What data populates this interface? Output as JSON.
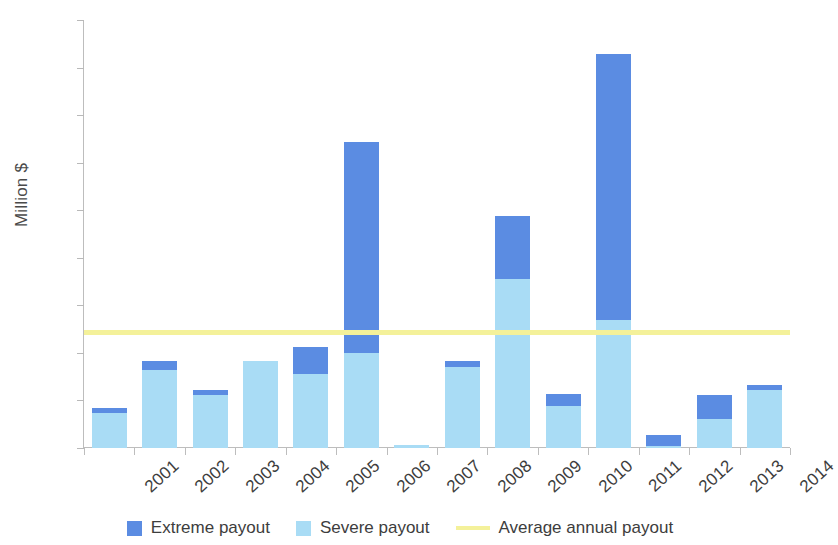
{
  "chart_data": {
    "type": "bar",
    "subtype": "stacked-bar-with-reference-line",
    "title": "",
    "xlabel": "",
    "ylabel": "Million $",
    "ylim": [
      0,
      45
    ],
    "ytick_step": 5,
    "yticks": [
      0,
      5,
      10,
      15,
      20,
      25,
      30,
      35,
      40,
      45
    ],
    "ytick_labels": [
      "0",
      "5",
      "10",
      "15",
      "20",
      "25",
      "30",
      "35",
      "40",
      "45"
    ],
    "grid": false,
    "legend_position": "bottom-center",
    "categories": [
      "2001",
      "2002",
      "2003",
      "2004",
      "2005",
      "2006",
      "2007",
      "2008",
      "2009",
      "2010",
      "2011",
      "2012",
      "2013",
      "2014"
    ],
    "series": [
      {
        "name": "Severe payout",
        "color": "#a9dcf5",
        "values": [
          3.7,
          8.2,
          5.6,
          9.1,
          7.8,
          10.0,
          0.3,
          8.5,
          17.8,
          4.4,
          13.5,
          0.2,
          3.1,
          6.1
        ]
      },
      {
        "name": "Extreme payout",
        "color": "#5b8ce2",
        "values": [
          0.5,
          0.9,
          0.5,
          0.0,
          2.8,
          22.2,
          0.0,
          0.7,
          6.6,
          1.3,
          27.9,
          1.2,
          2.5,
          0.5
        ]
      }
    ],
    "totals": [
      4.2,
      9.1,
      6.1,
      9.1,
      10.6,
      32.2,
      0.3,
      9.2,
      24.4,
      5.7,
      41.4,
      1.4,
      5.6,
      6.6
    ],
    "reference_line": {
      "name": "Average annual payout",
      "value": 12.2,
      "color": "#f4f19a"
    }
  },
  "legend": {
    "items": [
      {
        "label": "Extreme payout",
        "marker": "square",
        "color": "#5b8ce2"
      },
      {
        "label": "Severe payout",
        "marker": "square",
        "color": "#a9dcf5"
      },
      {
        "label": "Average annual payout",
        "marker": "line",
        "color": "#f4f19a"
      }
    ]
  }
}
